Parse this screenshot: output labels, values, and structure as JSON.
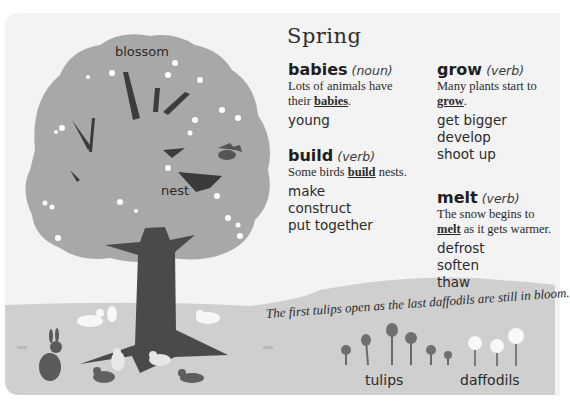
{
  "title": "Spring",
  "entries": [
    {
      "word": "babies",
      "pos": "(noun)",
      "example_before": "Lots of animals have their ",
      "example_key": "babies",
      "example_after": ".",
      "synonyms": [
        "young"
      ]
    },
    {
      "word": "build",
      "pos": "(verb)",
      "example_before": "Some birds ",
      "example_key": "build",
      "example_after": " nests.",
      "synonyms": [
        "make",
        "construct",
        "put together"
      ]
    },
    {
      "word": "grow",
      "pos": "(verb)",
      "example_before": "Many plants start to ",
      "example_key": "grow",
      "example_after": ".",
      "synonyms": [
        "get bigger",
        "develop",
        "shoot up"
      ]
    },
    {
      "word": "melt",
      "pos": "(verb)",
      "example_before": "The snow begins to ",
      "example_key": "melt",
      "example_after": " as it gets warmer.",
      "synonyms": [
        "defrost",
        "soften",
        "thaw"
      ]
    }
  ],
  "illustration": {
    "labels": {
      "blossom": "blossom",
      "nest": "nest",
      "tulips": "tulips",
      "daffodils": "daffodils"
    },
    "caption": "The first tulips open as the last daffodils are still in bloom."
  },
  "colors": {
    "canopy": "#a9a9a9",
    "trunk": "#4d4d4d",
    "ground": "#cfcfcf",
    "background": "#f3f3f3"
  }
}
